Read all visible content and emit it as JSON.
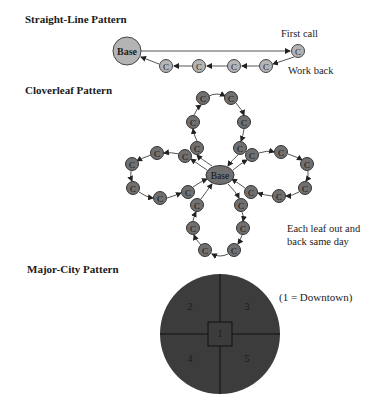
{
  "sections": {
    "straight_line": {
      "title": "Straight-Line Pattern",
      "base_label": "Base",
      "call_label": "C",
      "first_call_note": "First call",
      "work_back_note": "Work back"
    },
    "cloverleaf": {
      "title": "Cloverleaf Pattern",
      "base_label": "Base",
      "call_label": "C",
      "note_line1": "Each leaf out and",
      "note_line2": "back same day"
    },
    "major_city": {
      "title": "Major-City Pattern",
      "zones": [
        "1",
        "2",
        "3",
        "4",
        "5"
      ],
      "legend": "(1 = Downtown)"
    }
  },
  "colors": {
    "light_node": "#b4b4b4",
    "dark_node": "#707070",
    "city_fill": "#3c3c3c",
    "stroke": "#333333"
  }
}
